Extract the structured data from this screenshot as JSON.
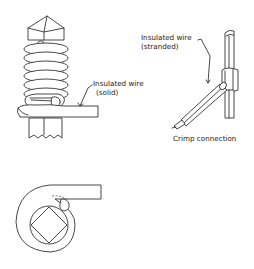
{
  "diagram": {
    "type": "technical-illustration",
    "panels": [
      {
        "id": "wire-wrap-side",
        "description": "Solid insulated wire wrapped in a helical coil around a square terminal post with pointed top",
        "label": {
          "line1": "Insulated wire",
          "line2": "(solid)"
        }
      },
      {
        "id": "crimp",
        "description": "Stranded insulated wire crimped into a flat terminal",
        "label": {
          "line1": "Insulated wire",
          "line2": "(stranded)"
        },
        "caption": "Crimp connection"
      },
      {
        "id": "wire-wrap-top",
        "description": "Top view of wire wrapped around a square post, shown as concentric circles with diamond post"
      }
    ]
  },
  "colors": {
    "line": "#333333",
    "background": "#ffffff"
  }
}
